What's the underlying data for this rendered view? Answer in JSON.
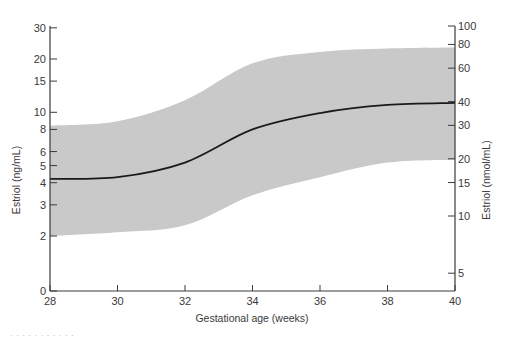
{
  "chart_data": {
    "type": "area",
    "title": "",
    "xlabel": "Gestational age (weeks)",
    "ylabel": "Estriol (ng/mL)",
    "ylabel_right": "Estriol (nmol/mL)",
    "x": [
      28,
      30,
      32,
      34,
      36,
      38,
      40
    ],
    "xlim": [
      28,
      40
    ],
    "x_ticks": [
      28,
      30,
      32,
      34,
      36,
      38,
      40
    ],
    "y_scale": "log",
    "y_ticks_left": [
      0,
      2,
      3,
      4,
      5,
      6,
      8,
      10,
      15,
      20,
      30
    ],
    "y_ticks_right": [
      5,
      10,
      15,
      20,
      30,
      40,
      60,
      80,
      100
    ],
    "series": [
      {
        "name": "Mean estriol",
        "kind": "line",
        "color": "#1a1a1a",
        "values": [
          4.2,
          4.3,
          5.2,
          8.0,
          9.9,
          11.0,
          11.3
        ]
      },
      {
        "name": "Upper limit of normal range",
        "kind": "band-upper",
        "color": "#c9c9c9",
        "values": [
          8.4,
          8.9,
          11.7,
          18.9,
          21.9,
          22.9,
          23.2
        ]
      },
      {
        "name": "Lower limit of normal range",
        "kind": "band-lower",
        "color": "#c9c9c9",
        "values": [
          2.0,
          2.1,
          2.3,
          3.4,
          4.3,
          5.2,
          5.4
        ]
      }
    ],
    "grid": false,
    "legend": "none"
  },
  "colors": {
    "band": "#c9c9c9",
    "line": "#1a1a1a",
    "axis": "#3a3a3a"
  },
  "caption": "·  ·  ·  ·  ·  ·  ·  ·  ·  ·  ·"
}
